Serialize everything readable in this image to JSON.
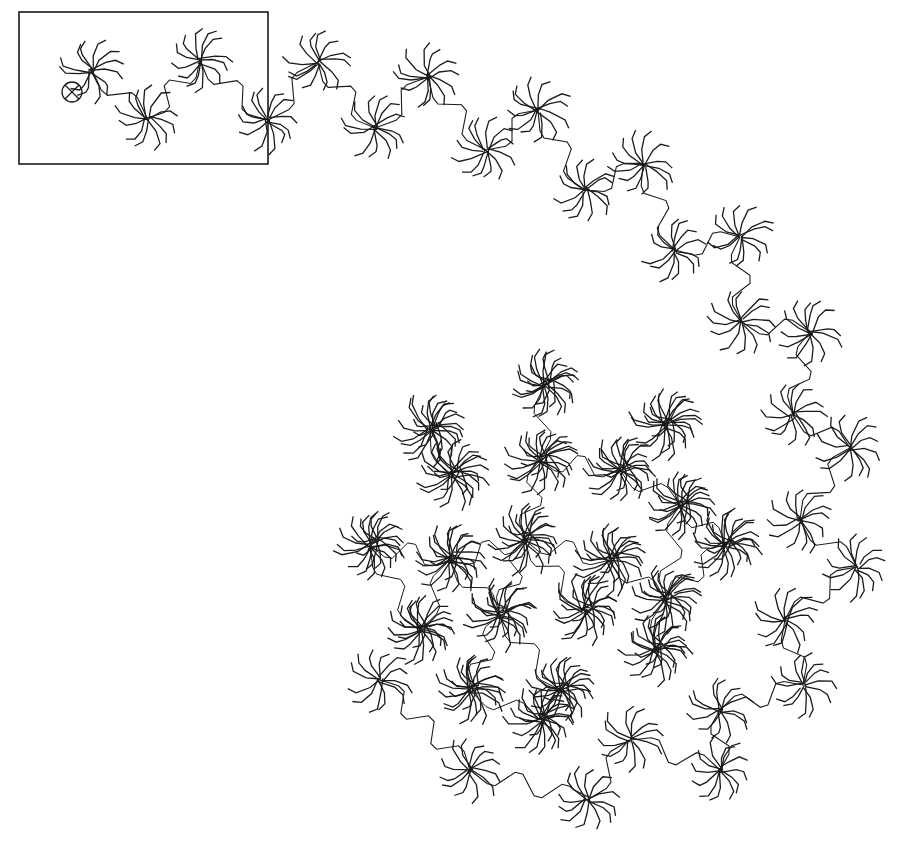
{
  "figure": {
    "background": "#ffffff",
    "stroke_color": "#1a1a1a",
    "inset_box": {
      "x": 19,
      "y": 12,
      "width": 249,
      "height": 152
    },
    "origin_marker": {
      "cx": 72,
      "cy": 92,
      "r": 10,
      "symbol": "circle-cross"
    },
    "chain_path_clusters": [
      [
        92,
        70
      ],
      [
        147,
        118
      ],
      [
        200,
        60
      ],
      [
        268,
        120
      ],
      [
        318,
        62
      ],
      [
        375,
        128
      ],
      [
        428,
        77
      ],
      [
        486,
        150
      ],
      [
        538,
        110
      ],
      [
        585,
        190
      ],
      [
        643,
        165
      ],
      [
        675,
        250
      ],
      [
        740,
        237
      ],
      [
        742,
        322
      ],
      [
        810,
        332
      ],
      [
        793,
        415
      ],
      [
        850,
        448
      ],
      [
        800,
        520
      ],
      [
        857,
        567
      ],
      [
        785,
        620
      ],
      [
        803,
        685
      ],
      [
        720,
        710
      ],
      [
        720,
        770
      ],
      [
        630,
        740
      ],
      [
        587,
        800
      ],
      [
        470,
        770
      ],
      [
        380,
        680
      ]
    ],
    "core_clusters": [
      [
        545,
        385
      ],
      [
        430,
        430
      ],
      [
        665,
        425
      ],
      [
        370,
        545
      ],
      [
        452,
        475
      ],
      [
        540,
        460
      ],
      [
        620,
        470
      ],
      [
        680,
        505
      ],
      [
        450,
        560
      ],
      [
        525,
        540
      ],
      [
        610,
        560
      ],
      [
        725,
        545
      ],
      [
        420,
        630
      ],
      [
        500,
        615
      ],
      [
        585,
        610
      ],
      [
        665,
        600
      ],
      [
        470,
        690
      ],
      [
        560,
        690
      ],
      [
        540,
        720
      ],
      [
        655,
        650
      ]
    ]
  }
}
